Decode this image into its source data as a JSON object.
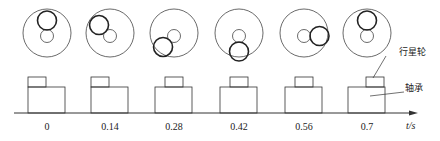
{
  "diagram": {
    "frames": [
      {
        "time_label": "0",
        "planet_angle_deg": 90,
        "block_offset": "left"
      },
      {
        "time_label": "0.14",
        "planet_angle_deg": 135,
        "block_offset": "left"
      },
      {
        "time_label": "0.28",
        "planet_angle_deg": 225,
        "block_offset": "center"
      },
      {
        "time_label": "0.42",
        "planet_angle_deg": 270,
        "block_offset": "center"
      },
      {
        "time_label": "0.56",
        "planet_angle_deg": 0,
        "block_offset": "center"
      },
      {
        "time_label": "0.7",
        "planet_angle_deg": 90,
        "block_offset": "right"
      }
    ],
    "axis_label": "t/s",
    "callouts": {
      "planet_gear": "行星轮",
      "bearing": "轴承"
    },
    "colors": {
      "stroke": "#333333",
      "bold_stroke": "#222222"
    }
  }
}
